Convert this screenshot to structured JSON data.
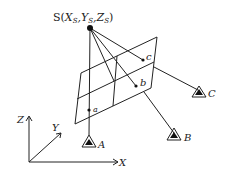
{
  "diagram": {
    "title_label": "S(X",
    "projection_center": {
      "label_prefix": "S(",
      "x_label": "X",
      "x_sub": "S",
      "y_label": "Y",
      "y_sub": "S",
      "z_label": "Z",
      "z_sub": "S",
      "label_suffix": ")"
    },
    "image_points": [
      {
        "label": "a"
      },
      {
        "label": "b"
      },
      {
        "label": "c"
      }
    ],
    "ground_points": [
      {
        "label": "A"
      },
      {
        "label": "B"
      },
      {
        "label": "C"
      }
    ],
    "axes": {
      "x": "X",
      "y": "Y",
      "z": "Z"
    }
  }
}
